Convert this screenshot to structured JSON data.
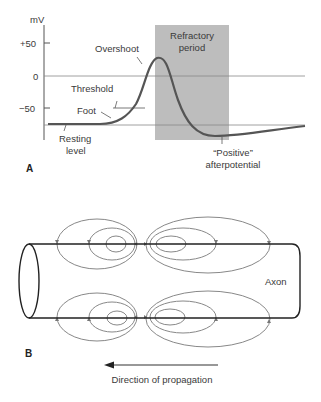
{
  "panel_a": {
    "letter": "A",
    "y_unit": "mV",
    "y_ticks": [
      {
        "label": "+50",
        "value": 50
      },
      {
        "label": "0",
        "value": 0
      },
      {
        "label": "−50",
        "value": -50
      }
    ],
    "labels": {
      "overshoot": "Overshoot",
      "threshold": "Threshold",
      "foot": "Foot",
      "resting_1": "Resting",
      "resting_2": "level",
      "refractory_1": "Refractory",
      "refractory_2": "period",
      "positive_1": "“Positive”",
      "positive_2": "afterpotential"
    },
    "colors": {
      "refractory_fill": "#bdbdbd",
      "curve": "#555555",
      "lines": "#777777"
    }
  },
  "panel_b": {
    "letter": "B",
    "axon_label": "Axon",
    "arrow_label": "Direction of propagation"
  }
}
